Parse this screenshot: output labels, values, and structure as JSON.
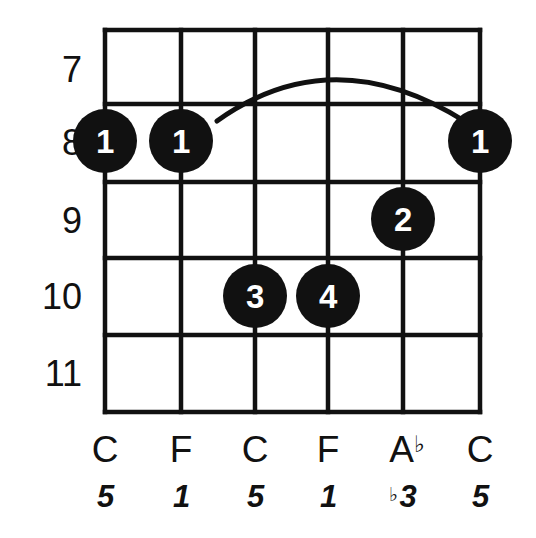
{
  "diagram": {
    "type": "chord-chart",
    "instrument": "guitar",
    "string_count": 6,
    "fret_numbers": [
      "7",
      "8",
      "9",
      "10",
      "11"
    ],
    "note_labels": [
      "C",
      "F",
      "C",
      "F",
      "A",
      "C"
    ],
    "note_accidentals": [
      "",
      "",
      "",
      "",
      "♭",
      ""
    ],
    "interval_labels": [
      "5",
      "1",
      "5",
      "1",
      "3",
      "5"
    ],
    "interval_accidentals": [
      "",
      "",
      "",
      "",
      "♭",
      ""
    ],
    "fingers": [
      {
        "label": "1",
        "string": 1,
        "fret": "8"
      },
      {
        "label": "1",
        "string": 2,
        "fret": "8"
      },
      {
        "label": "2",
        "string": 5,
        "fret": "9"
      },
      {
        "label": "3",
        "string": 3,
        "fret": "10"
      },
      {
        "label": "4",
        "string": 4,
        "fret": "10"
      },
      {
        "label": "1",
        "string": 6,
        "fret": "8"
      }
    ],
    "barre": {
      "name": "barre-arc",
      "fret": "8",
      "from_string": 2,
      "to_string": 6
    },
    "colors": {
      "ink": "#111111",
      "background": "#ffffff",
      "dot_text": "#ffffff"
    }
  }
}
